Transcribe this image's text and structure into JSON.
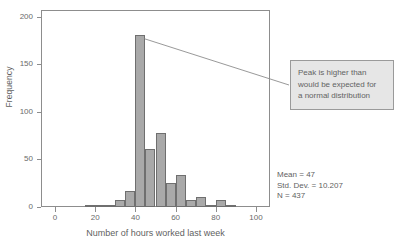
{
  "chart_data": {
    "type": "bar",
    "title": "",
    "subtitle": "",
    "xlabel": "Number of hours worked last week",
    "ylabel": "Frequency",
    "xlim": [
      -7,
      107
    ],
    "ylim": [
      0,
      207
    ],
    "xticks": [
      0,
      20,
      40,
      60,
      80,
      100
    ],
    "yticks": [
      0,
      50,
      100,
      150,
      200
    ],
    "grid": false,
    "legend": null,
    "bin_width": 5,
    "bins": [
      {
        "bin_start": 15,
        "bin_end": 20,
        "center": 17.5,
        "value": 1
      },
      {
        "bin_start": 20,
        "bin_end": 25,
        "center": 22.5,
        "value": 2
      },
      {
        "bin_start": 25,
        "bin_end": 30,
        "center": 27.5,
        "value": 1
      },
      {
        "bin_start": 30,
        "bin_end": 35,
        "center": 32.5,
        "value": 7
      },
      {
        "bin_start": 35,
        "bin_end": 40,
        "center": 37.5,
        "value": 17
      },
      {
        "bin_start": 40,
        "bin_end": 45,
        "center": 42.5,
        "value": 181
      },
      {
        "bin_start": 45,
        "bin_end": 50,
        "center": 47.5,
        "value": 61
      },
      {
        "bin_start": 50,
        "bin_end": 55,
        "center": 52.5,
        "value": 78
      },
      {
        "bin_start": 55,
        "bin_end": 60,
        "center": 57.5,
        "value": 25
      },
      {
        "bin_start": 60,
        "bin_end": 65,
        "center": 62.5,
        "value": 34
      },
      {
        "bin_start": 65,
        "bin_end": 70,
        "center": 67.5,
        "value": 7
      },
      {
        "bin_start": 70,
        "bin_end": 75,
        "center": 72.5,
        "value": 10
      },
      {
        "bin_start": 75,
        "bin_end": 80,
        "center": 77.5,
        "value": 1
      },
      {
        "bin_start": 80,
        "bin_end": 85,
        "center": 82.5,
        "value": 7
      },
      {
        "bin_start": 85,
        "bin_end": 90,
        "center": 87.5,
        "value": 2
      }
    ],
    "categories": [
      17.5,
      22.5,
      27.5,
      32.5,
      37.5,
      42.5,
      47.5,
      52.5,
      57.5,
      62.5,
      67.5,
      72.5,
      77.5,
      82.5,
      87.5
    ],
    "values": [
      1,
      2,
      1,
      7,
      17,
      181,
      61,
      78,
      25,
      34,
      7,
      10,
      1,
      7,
      2
    ],
    "annotations": [
      {
        "text": "Peak is higher than would be expected for a normal distribution",
        "lines": [
          "Peak is higher than",
          "would be expected for",
          "a normal distribution"
        ],
        "points_to_bin": 42.5
      }
    ],
    "statistics": {
      "mean_label": "Mean = 47",
      "std_dev_label": "Std. Dev. = 10.207",
      "n_label": "N = 437",
      "mean": 47,
      "std_dev": 10.207,
      "n": 437
    },
    "colors": {
      "bar_fill": "#a9a9a9",
      "bar_stroke": "#6f6f6f",
      "axis": "#8d8d8d",
      "text": "#6a6a6a",
      "annotation_background": "#e6e6e6",
      "annotation_border": "#9a9a9a",
      "background": "#ffffff"
    }
  },
  "axes": {
    "y_title": "Frequency",
    "x_title": "Number of hours worked last week",
    "y_tick_labels": [
      "0",
      "50",
      "100",
      "150",
      "200"
    ],
    "x_tick_labels": [
      "0",
      "20",
      "40",
      "60",
      "80",
      "100"
    ]
  },
  "annotation": {
    "line1": "Peak is higher than",
    "line2": "would be expected for",
    "line3": "a normal distribution"
  },
  "stats": {
    "mean": "Mean = 47",
    "std_dev": "Std. Dev. = 10.207",
    "n": "N = 437"
  }
}
